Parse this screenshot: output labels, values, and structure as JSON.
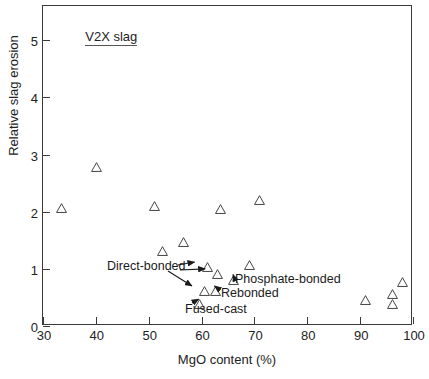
{
  "chart_data": {
    "type": "scatter",
    "title": "",
    "series_label": "V2X slag",
    "xlabel": "MgO content (%)",
    "ylabel": "Relative slag erosion",
    "xlim": [
      30,
      100
    ],
    "ylim": [
      0,
      5.6
    ],
    "xticks": [
      30,
      40,
      50,
      60,
      70,
      80,
      90,
      100
    ],
    "yticks": [
      0,
      1,
      2,
      3,
      4,
      5
    ],
    "grid": false,
    "legend_position": "none",
    "marker": "open-triangle",
    "series": [
      {
        "name": "V2X slag",
        "points": [
          {
            "x": 32.5,
            "y": 2.15
          },
          {
            "x": 39.0,
            "y": 2.87
          },
          {
            "x": 50.0,
            "y": 2.18
          },
          {
            "x": 51.5,
            "y": 1.4
          },
          {
            "x": 55.5,
            "y": 1.56
          },
          {
            "x": 58.5,
            "y": 0.47
          },
          {
            "x": 59.5,
            "y": 0.7
          },
          {
            "x": 60.0,
            "y": 1.12
          },
          {
            "x": 61.5,
            "y": 0.7
          },
          {
            "x": 62.0,
            "y": 1.0
          },
          {
            "x": 62.5,
            "y": 2.13
          },
          {
            "x": 65.0,
            "y": 0.9
          },
          {
            "x": 68.0,
            "y": 1.15
          },
          {
            "x": 70.0,
            "y": 2.3
          },
          {
            "x": 90.0,
            "y": 0.55
          },
          {
            "x": 95.0,
            "y": 0.65
          },
          {
            "x": 95.0,
            "y": 0.47
          },
          {
            "x": 97.0,
            "y": 0.85
          }
        ]
      }
    ],
    "annotations": [
      {
        "label": "Direct-bonded",
        "targets": [
          {
            "x": 60.0,
            "y": 1.12
          },
          {
            "x": 59.5,
            "y": 0.7
          }
        ]
      },
      {
        "label": "Phosphate-bonded",
        "targets": [
          {
            "x": 65.0,
            "y": 0.9
          }
        ]
      },
      {
        "label": "Rebonded",
        "targets": [
          {
            "x": 61.5,
            "y": 0.7
          }
        ]
      },
      {
        "label": "Fused-cast",
        "targets": [
          {
            "x": 58.5,
            "y": 0.47
          }
        ]
      }
    ]
  },
  "annotation_text": {
    "direct_bonded": "Direct-bonded",
    "phosphate_bonded": "Phosphate-bonded",
    "rebonded": "Rebonded",
    "fused_cast": "Fused-cast"
  },
  "colors": {
    "axis": "#3a3a3a",
    "text": "#222222",
    "marker_stroke": "#3d3d3d",
    "background": "#ffffff"
  }
}
